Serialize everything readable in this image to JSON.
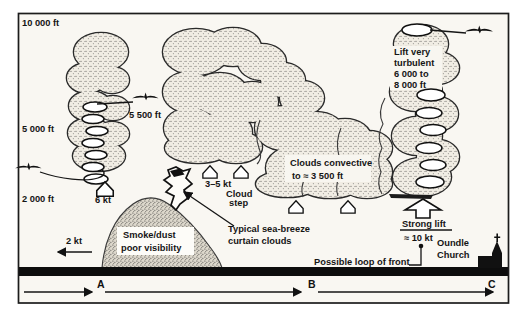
{
  "diagram": {
    "altitudes": {
      "a10000": "10 000 ft",
      "a5000": "5 000 ft",
      "a2000": "2 000 ft",
      "a5500": "5 500 ft"
    },
    "winds": {
      "w6": "6 kt",
      "w2": "2 kt",
      "w35": "3–5 kt"
    },
    "smoke": {
      "l1": "Smoke/dust",
      "l2": "poor visibility"
    },
    "cloud_step": {
      "l1": "Cloud",
      "l2": "step"
    },
    "curtain": {
      "l1": "Typical sea-breeze",
      "l2": "curtain clouds"
    },
    "convective": {
      "l1": "Clouds convective",
      "l2": "to ≈ 3 500 ft"
    },
    "lift": {
      "l1": "Lift very",
      "l2": "turbulent",
      "l3": "6 000 to",
      "l4": "8 000 ft"
    },
    "strong_lift": {
      "title": "Strong lift",
      "value": "≈ 10 kt"
    },
    "front_label": "Possible loop of front",
    "church": {
      "l1": "Oundle",
      "l2": "Church"
    },
    "scale": {
      "a": "A",
      "b": "B",
      "c": "C"
    },
    "colors": {
      "ink": "#151515",
      "paper": "#f9f7f2",
      "ground": "#0d0d0d"
    }
  }
}
